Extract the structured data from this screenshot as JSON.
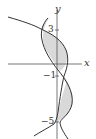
{
  "figure": {
    "axes": {
      "x_label": "x",
      "y_label": "y"
    },
    "tick_labels": {
      "top": "3",
      "middle": "-1",
      "bottom": "-5"
    },
    "colors": {
      "line": "#333333",
      "fill": "#d9d9d9",
      "axis": "#555555"
    }
  }
}
